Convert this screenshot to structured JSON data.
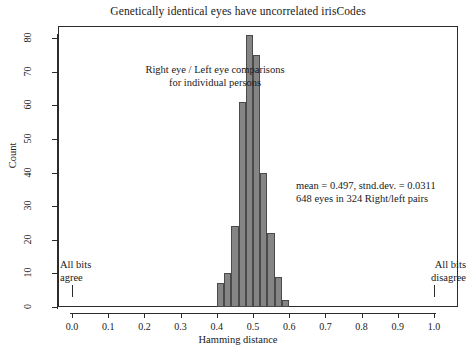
{
  "chart_data": {
    "type": "bar",
    "title": "Genetically identical eyes have uncorrelated irisCodes",
    "xlabel": "Hamming distance",
    "ylabel": "Count",
    "xlim": [
      0.0,
      1.0
    ],
    "ylim": [
      0,
      80
    ],
    "grid": false,
    "legend": null,
    "bin_width": 0.02,
    "categories": [
      "0.40",
      "0.42",
      "0.44",
      "0.46",
      "0.48",
      "0.50",
      "0.52",
      "0.54",
      "0.56",
      "0.58"
    ],
    "bin_edges": [
      0.4,
      0.42,
      0.44,
      0.46,
      0.48,
      0.5,
      0.52,
      0.54,
      0.56,
      0.58,
      0.6
    ],
    "values": [
      7,
      10,
      24,
      61,
      81,
      75,
      40,
      22,
      9,
      2
    ],
    "bars": [
      {
        "x0": 0.4,
        "x1": 0.42,
        "value": 7
      },
      {
        "x0": 0.42,
        "x1": 0.44,
        "value": 10
      },
      {
        "x0": 0.44,
        "x1": 0.46,
        "value": 24
      },
      {
        "x0": 0.46,
        "x1": 0.48,
        "value": 61
      },
      {
        "x0": 0.48,
        "x1": 0.5,
        "value": 81
      },
      {
        "x0": 0.5,
        "x1": 0.52,
        "value": 75
      },
      {
        "x0": 0.52,
        "x1": 0.54,
        "value": 40
      },
      {
        "x0": 0.54,
        "x1": 0.56,
        "value": 22
      },
      {
        "x0": 0.56,
        "x1": 0.58,
        "value": 9
      },
      {
        "x0": 0.58,
        "x1": 0.6,
        "value": 2
      }
    ],
    "x_ticks": [
      "0.0",
      "0.1",
      "0.2",
      "0.3",
      "0.4",
      "0.5",
      "0.6",
      "0.7",
      "0.8",
      "0.9",
      "1.0"
    ],
    "x_tick_values": [
      0.0,
      0.1,
      0.2,
      0.3,
      0.4,
      0.5,
      0.6,
      0.7,
      0.8,
      0.9,
      1.0
    ],
    "y_ticks": [
      "0",
      "10",
      "20",
      "30",
      "40",
      "50",
      "60",
      "70",
      "80"
    ],
    "y_tick_values": [
      0,
      10,
      20,
      30,
      40,
      50,
      60,
      70,
      80
    ],
    "annotations": [
      {
        "name": "comparison-caption",
        "line1": "Right eye / Left eye comparisons",
        "line2": "for individual persons"
      },
      {
        "name": "statistics-caption",
        "line1": "mean = 0.497,  stnd.dev. = 0.0311",
        "line2": "648 eyes in 324 Right/left pairs"
      },
      {
        "name": "all-bits-agree-marker",
        "line1": "All bits",
        "line2": "agree",
        "at_x": 0.0
      },
      {
        "name": "all-bits-disagree-marker",
        "line1": "All bits",
        "line2": "disagree",
        "at_x": 1.0
      }
    ],
    "colors": {
      "bar_fill": "#858585",
      "bar_border": "#4a4a4a",
      "axis": "#2b2b2b",
      "text": "#1a1a1a",
      "background": "#ffffff"
    },
    "statistics": {
      "mean": 0.497,
      "std_dev": 0.0311,
      "n_eyes": 648,
      "n_pairs": 324
    }
  }
}
